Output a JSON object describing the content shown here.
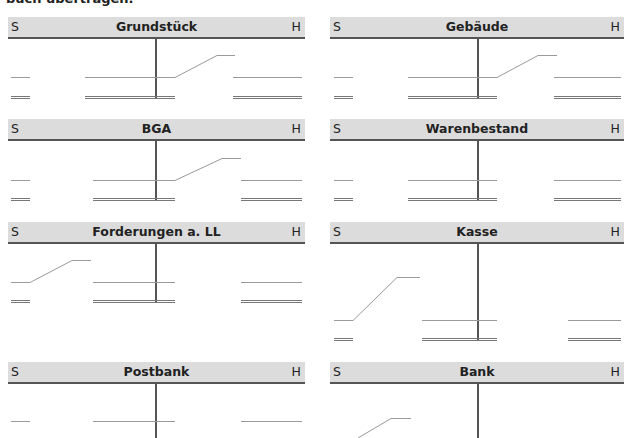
{
  "page": {
    "top_text": "buch übertragen."
  },
  "t_accounts": [
    {
      "title": "Grundstück",
      "debit_label": "S",
      "credit_label": "H"
    },
    {
      "title": "Gebäude",
      "debit_label": "S",
      "credit_label": "H"
    },
    {
      "title": "BGA",
      "debit_label": "S",
      "credit_label": "H"
    },
    {
      "title": "Warenbestand",
      "debit_label": "S",
      "credit_label": "H"
    },
    {
      "title": "Forderungen a. LL",
      "debit_label": "S",
      "credit_label": "H"
    },
    {
      "title": "Kasse",
      "debit_label": "S",
      "credit_label": "H"
    },
    {
      "title": "Postbank",
      "debit_label": "S",
      "credit_label": "H"
    },
    {
      "title": "Bank",
      "debit_label": "S",
      "credit_label": "H"
    }
  ],
  "colors": {
    "header_bg": "#dcdcdc",
    "header_rule": "#555555",
    "entry_line": "#9a9a9a"
  }
}
